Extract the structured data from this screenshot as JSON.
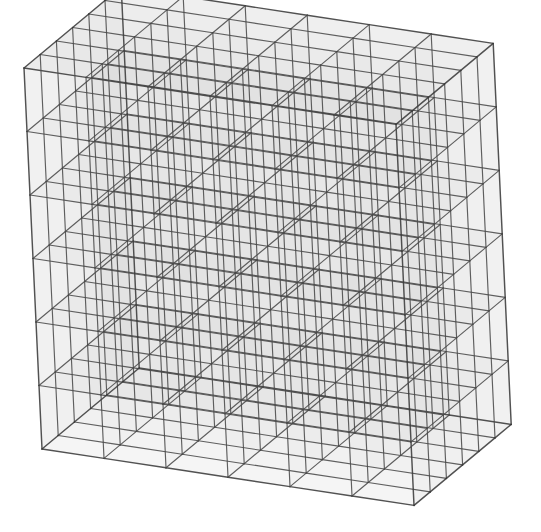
{
  "figure": {
    "kind": "wireframe-voxel-grid",
    "background_color": "#ffffff",
    "canvas": {
      "width": 541,
      "height": 532
    }
  },
  "geometry": {
    "divisions_x": 6,
    "divisions_y": 6,
    "divisions_z": 6,
    "total_voxels": 216,
    "projection": "oblique-axonometric",
    "origin": {
      "x": 42,
      "y": 449
    },
    "axis_x": {
      "dx": 62.0,
      "dy": 9.4
    },
    "axis_y": {
      "dx": -3.0,
      "dy": -63.5
    },
    "axis_z": {
      "dx": 16.2,
      "dy": -13.5
    }
  },
  "style": {
    "edge_color": "#4a4a4a",
    "edge_color_outer": "#3a3a3a",
    "edge_width": 1.15,
    "edge_width_outer": 1.45,
    "edge_opacity": 0.88,
    "face_fill_top": "#b8b8b8",
    "face_fill_front": "#d6d6d6",
    "face_fill_side": "#c4c4c4",
    "face_opacity_top": 0.17,
    "face_opacity_front": 0.13,
    "face_opacity_side": 0.15
  },
  "labels": {
    "figure_caption": "",
    "axis_x": "",
    "axis_y": "",
    "axis_z": ""
  },
  "chart_data": {
    "type": "other",
    "grid": {
      "nx": 6,
      "ny": 6,
      "nz": 6
    },
    "vertices_per_axis": 7,
    "total_cells": 216,
    "visible_faces": [
      "top",
      "front",
      "right"
    ],
    "xlabel": "",
    "ylabel": "",
    "zlabel": ""
  }
}
